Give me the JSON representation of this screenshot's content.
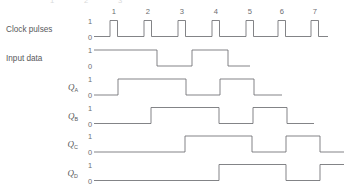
{
  "figure": {
    "background_color": "#ffffff",
    "line_color": "#6d6e71",
    "text_color": "#58595b",
    "width": 344,
    "height": 189
  },
  "clock_numbers": [
    "1",
    "2",
    "3",
    "4",
    "5",
    "6",
    "7"
  ],
  "levels": {
    "high": "1",
    "low": "0"
  },
  "rows": [
    {
      "key": "clock",
      "label": "Clock pulses",
      "label_style": "plain",
      "subscript": "",
      "baseline_y": 36.5,
      "high_y": 20.5,
      "level_high_label": "1",
      "level_low_label": "0",
      "type": "pulse-train",
      "start_x": 94,
      "end_x": 328,
      "pulse_rise_x": [
        110,
        144,
        178,
        212,
        246,
        278,
        311
      ],
      "pulse_width": 7.5
    },
    {
      "key": "input_data",
      "label": "Input data",
      "label_style": "plain",
      "subscript": "",
      "baseline_y": 66,
      "high_y": 50,
      "level_high_label": "1",
      "level_low_label": "0",
      "type": "level",
      "start_x": 94,
      "end_x": 250,
      "start_level": 1,
      "transitions_x": [
        157,
        192,
        228
      ]
    },
    {
      "key": "q_a",
      "label": "Q",
      "label_style": "italic-sub",
      "subscript": "A",
      "baseline_y": 95,
      "high_y": 79,
      "level_high_label": "1",
      "level_low_label": "0",
      "type": "level",
      "start_x": 94,
      "end_x": 282,
      "start_level": 0,
      "transitions_x": [
        118,
        186,
        220,
        254
      ]
    },
    {
      "key": "q_b",
      "label": "Q",
      "label_style": "italic-sub",
      "subscript": "B",
      "baseline_y": 123.5,
      "high_y": 107.5,
      "level_high_label": "1",
      "level_low_label": "0",
      "type": "level",
      "start_x": 94,
      "end_x": 314,
      "start_level": 0,
      "transitions_x": [
        151,
        219,
        253,
        287
      ]
    },
    {
      "key": "q_c",
      "label": "Q",
      "label_style": "italic-sub",
      "subscript": "C",
      "baseline_y": 152,
      "high_y": 136,
      "level_high_label": "1",
      "level_low_label": "0",
      "type": "level",
      "start_x": 94,
      "end_x": 344,
      "start_level": 0,
      "transitions_x": [
        185,
        252,
        286,
        320
      ]
    },
    {
      "key": "q_d",
      "label": "Q",
      "label_style": "italic-sub",
      "subscript": "D",
      "baseline_y": 180.5,
      "high_y": 164.5,
      "level_high_label": "1",
      "level_low_label": "0",
      "type": "level",
      "start_x": 94,
      "end_x": 344,
      "start_level": 0,
      "transitions_x": [
        219,
        286,
        320
      ]
    }
  ],
  "label_x": 78,
  "level_label_x": 92,
  "pulse_number_y": 14,
  "cropped_top_numbers": [
    "1",
    "2",
    "3"
  ]
}
